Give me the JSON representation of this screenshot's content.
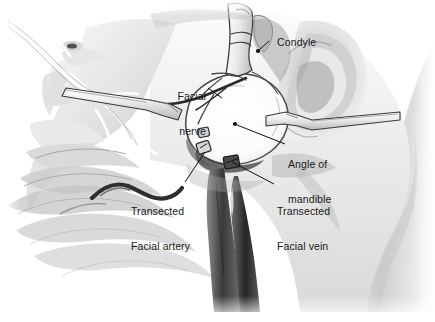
{
  "figure": {
    "type": "medical-illustration",
    "style": "grayscale pen-and-wash anatomical drawing",
    "background_color": "#ffffff",
    "text_color": "#1a1a1a",
    "leader_color": "#111111"
  },
  "labels": [
    {
      "id": "condyle",
      "text": "Condyle",
      "lines": [
        "Condyle"
      ],
      "align": "left",
      "x": 265,
      "y": 25,
      "leader": {
        "from_x": 269,
        "from_y": 41,
        "to_x": 259,
        "to_y": 50
      },
      "dot": {
        "x": 258,
        "y": 51
      }
    },
    {
      "id": "facial-nerve",
      "text": "Facial nerve",
      "lines": [
        "Facial",
        "nerve"
      ],
      "align": "right",
      "x": 176,
      "y": 68,
      "leader": {
        "from_x": 208,
        "from_y": 88,
        "to_x": 222,
        "to_y": 98
      },
      "dot": null
    },
    {
      "id": "angle-of-mandible",
      "text": "Angle of mandible",
      "lines": [
        "Angle of",
        "mandible"
      ],
      "align": "left",
      "x": 288,
      "y": 136,
      "leader": {
        "from_x": 285,
        "from_y": 144,
        "to_x": 237,
        "to_y": 125
      },
      "dot": {
        "x": 235,
        "y": 124
      }
    },
    {
      "id": "transected-facial-artery",
      "text": "Transected Facial artery",
      "lines": [
        "Transected",
        "Facial artery"
      ],
      "align": "left",
      "x": 131,
      "y": 183,
      "leader": {
        "from_x": 185,
        "from_y": 182,
        "to_x": 205,
        "to_y": 152
      },
      "dot": null
    },
    {
      "id": "transected-facial-vein",
      "text": "Transected Facial vein",
      "lines": [
        "Transected",
        "Facial vein"
      ],
      "align": "left",
      "x": 277,
      "y": 183,
      "leader": {
        "from_x": 274,
        "from_y": 184,
        "to_x": 232,
        "to_y": 162
      },
      "dot": null
    }
  ],
  "structures": [
    {
      "name": "mandibular-ramus-condyle",
      "note": "cut bone of ramus at top center"
    },
    {
      "name": "parotid-bed",
      "note": "large pale field at center of dissection"
    },
    {
      "name": "retractor-superior",
      "note": "instrument entering from left across cheek"
    },
    {
      "name": "retractor-posterior",
      "note": "instrument entering from right behind ear"
    },
    {
      "name": "facial-artery-stump",
      "note": "clamped vessel stump, upper of the pair"
    },
    {
      "name": "facial-vein-stump",
      "note": "clamped vessel stump, lower of the pair"
    },
    {
      "name": "neck-vessels",
      "note": "dark vascular bundle descending into neck"
    },
    {
      "name": "auricle",
      "note": "ear outline posterior to dissection"
    },
    {
      "name": "facial-profile",
      "note": "nose, orbit, lips, chin at left"
    }
  ]
}
